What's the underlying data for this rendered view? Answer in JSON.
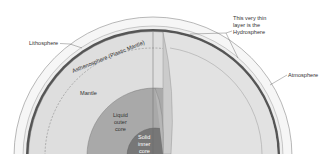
{
  "labels": {
    "lithosphere": "Lithosphere",
    "asthenosphere": "Asthenosphere (Plastic Mantle)",
    "hydrosphere_line1": "This very thin",
    "hydrosphere_line2": "layer is the",
    "hydrosphere_line3": "Hydrosphere",
    "atmosphere": "Atmosphere",
    "mantle": "Mantle",
    "outer_core_line1": "Liquid",
    "outer_core_line2": "outer",
    "outer_core_line3": "core",
    "inner_core_line1": "Solid",
    "inner_core_line2": "inner",
    "inner_core_line3": "core"
  },
  "colors": {
    "background": "#ffffff",
    "atmosphere": "#f3f3f3",
    "crust_band": "#555555",
    "mantle": "#dcdcdc",
    "mantle_face": "#e4e4e4",
    "outer_core": "#a8a8a8",
    "inner_core": "#777777",
    "cut_face": "#c8c8c8",
    "outline": "#8a8a8a"
  }
}
